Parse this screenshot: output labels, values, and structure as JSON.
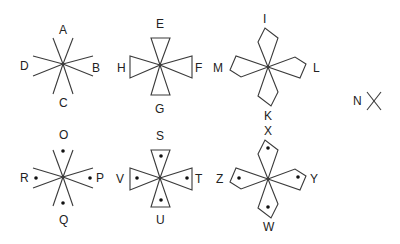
{
  "diagram": {
    "type": "symbol-figures",
    "line_color": "#3a3a3a",
    "figures": [
      {
        "id": "fig1",
        "shape": "open-wedges",
        "dotted": false,
        "center": [
          63,
          64
        ],
        "labels": {
          "top": "A",
          "right": "B",
          "bottom": "C",
          "left": "D"
        }
      },
      {
        "id": "fig2",
        "shape": "triangles",
        "dotted": false,
        "center": [
          160,
          65
        ],
        "labels": {
          "top": "E",
          "right": "F",
          "bottom": "G",
          "left": "H"
        }
      },
      {
        "id": "fig3",
        "shape": "kites",
        "dotted": false,
        "center": [
          268,
          67
        ],
        "labels": {
          "top": "I",
          "right": "L",
          "bottom": "K",
          "left": "M"
        }
      },
      {
        "id": "fig4",
        "shape": "open-wedges",
        "dotted": true,
        "center": [
          63,
          177
        ],
        "labels": {
          "top": "O",
          "right": "P",
          "bottom": "Q",
          "left": "R"
        }
      },
      {
        "id": "fig5",
        "shape": "triangles",
        "dotted": true,
        "center": [
          160,
          178
        ],
        "labels": {
          "top": "S",
          "right": "T",
          "bottom": "U",
          "left": "V"
        }
      },
      {
        "id": "fig6",
        "shape": "kites",
        "dotted": true,
        "center": [
          268,
          179
        ],
        "labels": {
          "top": "X",
          "right": "Y",
          "bottom": "W",
          "left": "Z"
        }
      },
      {
        "id": "fig7",
        "shape": "single-cross",
        "dotted": false,
        "center": [
          373,
          100
        ],
        "labels": {
          "left": "N"
        }
      }
    ]
  }
}
